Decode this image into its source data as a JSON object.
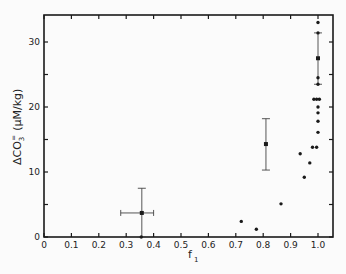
{
  "chart_data": {
    "type": "scatter",
    "title": "",
    "xlabel": "f1",
    "ylabel": "ΔCO3= (μM/kg)",
    "xlim": [
      0,
      1.0
    ],
    "ylim": [
      0,
      34
    ],
    "x_ticks": [
      "0",
      "0.1",
      "0.2",
      "0.3",
      "0.4",
      "0.5",
      "0.6",
      "0.7",
      "0.8",
      "0.9",
      "1.0"
    ],
    "y_ticks": [
      "0",
      "10",
      "20",
      "30"
    ],
    "grid": false,
    "series": [
      {
        "name": "points",
        "marker": "dot",
        "points": [
          {
            "x": 0.355,
            "y": 0.0
          },
          {
            "x": 0.72,
            "y": 2.4
          },
          {
            "x": 0.775,
            "y": 1.2
          },
          {
            "x": 0.865,
            "y": 5.1
          },
          {
            "x": 0.935,
            "y": 12.8
          },
          {
            "x": 0.95,
            "y": 9.2
          },
          {
            "x": 0.97,
            "y": 11.4
          },
          {
            "x": 0.98,
            "y": 13.8
          },
          {
            "x": 0.995,
            "y": 13.8
          },
          {
            "x": 0.985,
            "y": 21.2
          },
          {
            "x": 0.995,
            "y": 21.2
          },
          {
            "x": 1.005,
            "y": 21.2
          },
          {
            "x": 1.0,
            "y": 20.0
          },
          {
            "x": 1.0,
            "y": 19.1
          },
          {
            "x": 1.0,
            "y": 17.8
          },
          {
            "x": 1.0,
            "y": 16.1
          },
          {
            "x": 1.0,
            "y": 23.5
          },
          {
            "x": 1.0,
            "y": 24.5
          },
          {
            "x": 1.0,
            "y": 31.4
          },
          {
            "x": 1.0,
            "y": 33.0
          }
        ]
      },
      {
        "name": "means with error bars",
        "marker": "square",
        "points": [
          {
            "x": 0.357,
            "y": 3.7,
            "x_err": [
              0.28,
              0.4
            ],
            "y_err": [
              0.0,
              7.5
            ]
          },
          {
            "x": 0.81,
            "y": 14.3,
            "x_err": null,
            "y_err": [
              10.3,
              18.2
            ]
          },
          {
            "x": 1.0,
            "y": 27.5,
            "x_err": null,
            "y_err": [
              23.5,
              31.4
            ]
          }
        ]
      }
    ]
  },
  "labels": {
    "ylabel_main": "ΔCO",
    "ylabel_sub": "3",
    "ylabel_sup": "=",
    "ylabel_units": "(μM/kg)",
    "xlabel_main": "f",
    "xlabel_sub": "1"
  }
}
